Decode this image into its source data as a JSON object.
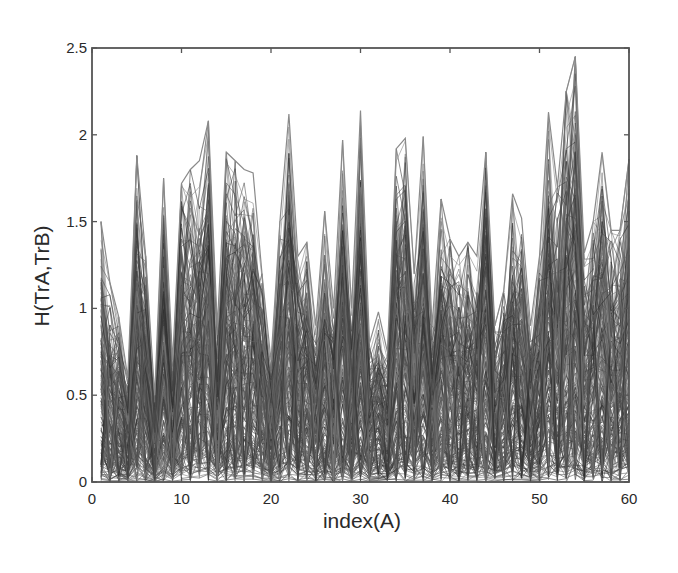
{
  "chart_data": {
    "type": "line",
    "title": "",
    "xlabel": "index(A)",
    "ylabel": "H(TrA,TrB)",
    "xlim": [
      0,
      60
    ],
    "ylim": [
      0,
      2.5
    ],
    "xticks": [
      0,
      10,
      20,
      30,
      40,
      50,
      60
    ],
    "yticks": [
      0,
      0.5,
      1,
      1.5,
      2,
      2.5
    ],
    "xtick_labels": [
      "0",
      "10",
      "20",
      "30",
      "40",
      "50",
      "60"
    ],
    "ytick_labels": [
      "0",
      "0.5",
      "1",
      "1.5",
      "2",
      "2.5"
    ],
    "grid": false,
    "legend": null,
    "series_count_estimate": 200,
    "series_color": "#3a3a3a",
    "x": [
      1,
      2,
      3,
      4,
      5,
      6,
      7,
      8,
      9,
      10,
      11,
      12,
      13,
      14,
      15,
      16,
      17,
      18,
      19,
      20,
      21,
      22,
      23,
      24,
      25,
      26,
      27,
      28,
      29,
      30,
      31,
      32,
      33,
      34,
      35,
      36,
      37,
      38,
      39,
      40,
      41,
      42,
      43,
      44,
      45,
      46,
      47,
      48,
      49,
      50,
      51,
      52,
      53,
      54,
      55,
      56,
      57,
      58,
      59,
      60
    ],
    "envelope_max": [
      1.5,
      1.15,
      0.95,
      0.6,
      1.88,
      1.3,
      0.5,
      1.75,
      0.7,
      1.72,
      1.8,
      1.85,
      2.08,
      0.9,
      1.9,
      1.85,
      1.8,
      1.78,
      1.2,
      0.7,
      1.5,
      2.12,
      1.3,
      1.38,
      0.9,
      1.56,
      1.0,
      1.97,
      1.0,
      2.14,
      0.8,
      0.98,
      0.75,
      1.92,
      1.98,
      1.2,
      1.99,
      0.9,
      1.63,
      1.4,
      1.3,
      1.38,
      1.3,
      1.9,
      0.9,
      1.1,
      1.66,
      1.52,
      0.9,
      1.3,
      2.13,
      1.7,
      2.25,
      2.45,
      1.32,
      1.5,
      1.9,
      1.45,
      1.45,
      1.86
    ],
    "envelope_min": 0
  },
  "plot_area": {
    "left": 92,
    "top": 48,
    "right": 629,
    "bottom": 482
  },
  "colors": {
    "frame": "#555555",
    "lines": "#3a3a3a",
    "background": "#ffffff"
  }
}
